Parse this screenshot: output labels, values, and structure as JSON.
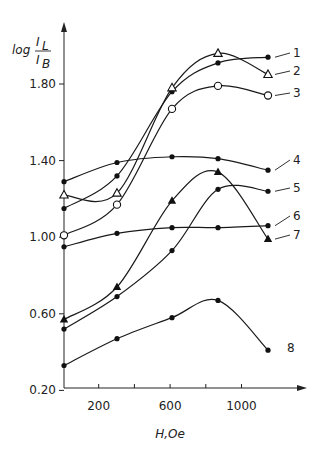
{
  "chart_data": {
    "type": "line",
    "title": "",
    "xlabel": "H, Oe",
    "ylabel": "log I_L / I_B",
    "ylabel_parts": {
      "prefix": "log",
      "numerator": "I",
      "numerator_sub": "L",
      "denominator": "I",
      "denominator_sub": "B"
    },
    "xlim": [
      0,
      1400
    ],
    "ylim": [
      0.2,
      2.05
    ],
    "x_ticks": [
      200,
      400,
      600,
      800,
      1000
    ],
    "x_tick_labels": [
      "200",
      "",
      "600",
      "",
      "1000"
    ],
    "y_ticks": [
      0.2,
      0.6,
      1.0,
      1.4,
      1.8
    ],
    "y_tick_labels": [
      "0.20",
      "0.60",
      "1.00",
      "1.40",
      "1.80"
    ],
    "grid": false,
    "legend_position": "right (curve number labels)",
    "x": [
      50,
      300,
      600,
      850,
      1130
    ],
    "series": [
      {
        "name": "1",
        "marker": "filled-circle",
        "values": [
          1.15,
          1.32,
          1.76,
          1.91,
          1.94
        ]
      },
      {
        "name": "2",
        "marker": "open-triangle",
        "values": [
          1.22,
          1.23,
          1.78,
          1.96,
          1.85
        ]
      },
      {
        "name": "3",
        "marker": "open-circle",
        "values": [
          1.01,
          1.17,
          1.67,
          1.79,
          1.74
        ]
      },
      {
        "name": "4",
        "marker": "filled-circle",
        "values": [
          1.29,
          1.39,
          1.42,
          1.41,
          1.35
        ]
      },
      {
        "name": "5",
        "marker": "filled-circle",
        "values": [
          0.52,
          0.69,
          0.93,
          1.25,
          1.24
        ]
      },
      {
        "name": "6",
        "marker": "filled-circle",
        "values": [
          0.95,
          1.02,
          1.05,
          1.05,
          1.06
        ]
      },
      {
        "name": "7",
        "marker": "filled-triangle",
        "values": [
          0.57,
          0.74,
          1.19,
          1.34,
          0.99
        ]
      },
      {
        "name": "8",
        "marker": "filled-circle",
        "values": [
          0.33,
          0.47,
          0.58,
          0.67,
          0.41
        ]
      }
    ]
  }
}
